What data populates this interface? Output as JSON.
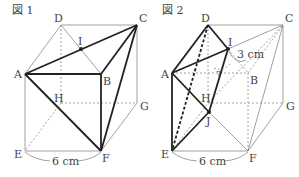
{
  "figure1": {
    "title": "図 1",
    "labels": {
      "A": "A",
      "B": "B",
      "C": "C",
      "D": "D",
      "E": "E",
      "F": "F",
      "G": "G",
      "H": "H",
      "I": "I"
    },
    "dimension": "6 cm"
  },
  "figure2": {
    "title": "図 2",
    "labels": {
      "A": "A",
      "B": "B",
      "C": "C",
      "D": "D",
      "E": "E",
      "F": "F",
      "G": "G",
      "H": "H",
      "I": "I",
      "J": "J"
    },
    "dimension": "6 cm",
    "arc_dimension": "3 cm",
    "angle_mark": "7"
  },
  "colors": {
    "bold": "#222222",
    "thin": "#888888",
    "text": "#444444"
  }
}
